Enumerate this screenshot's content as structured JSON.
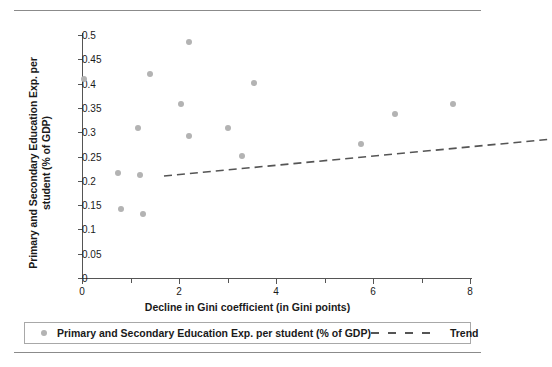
{
  "chart_data": {
    "type": "scatter",
    "title": "",
    "xlabel": "Decline in Gini coefficient (in Gini points)",
    "ylabel": "Primary and Secondary Education Exp. per student (% of GDP)",
    "xlim": [
      0,
      8
    ],
    "ylim": [
      0,
      0.5
    ],
    "grid": false,
    "legend_position": "bottom",
    "x_ticks": [
      0,
      2,
      4,
      6,
      8
    ],
    "x_tick_labels": [
      "0",
      "2",
      "4",
      "6",
      "8"
    ],
    "x_minor_ticks": [
      1,
      3,
      5,
      7
    ],
    "y_ticks": [
      0,
      0.05,
      0.1,
      0.15,
      0.2,
      0.25,
      0.3,
      0.35,
      0.4,
      0.45,
      0.5
    ],
    "y_tick_labels": [
      "0",
      "0.05",
      "0.1",
      "0.15",
      "0.2",
      "0.25",
      "0.3",
      "0.35",
      "0.4",
      "0.45",
      "0.5"
    ],
    "series": [
      {
        "name": "Primary and Secondary Education Exp. per student (% of GDP)",
        "marker": "circle",
        "color": "#b3b3b3",
        "points": [
          {
            "x": 0.05,
            "y": 0.41
          },
          {
            "x": 0.75,
            "y": 0.217
          },
          {
            "x": 0.8,
            "y": 0.143
          },
          {
            "x": 1.15,
            "y": 0.308
          },
          {
            "x": 1.2,
            "y": 0.211
          },
          {
            "x": 1.25,
            "y": 0.132
          },
          {
            "x": 1.4,
            "y": 0.42
          },
          {
            "x": 2.05,
            "y": 0.358
          },
          {
            "x": 2.2,
            "y": 0.485
          },
          {
            "x": 2.2,
            "y": 0.293
          },
          {
            "x": 3.0,
            "y": 0.308
          },
          {
            "x": 3.3,
            "y": 0.252
          },
          {
            "x": 3.55,
            "y": 0.401
          },
          {
            "x": 5.75,
            "y": 0.276
          },
          {
            "x": 6.45,
            "y": 0.337
          },
          {
            "x": 7.65,
            "y": 0.358
          }
        ]
      },
      {
        "name": "Trend",
        "marker": "dashed-line",
        "color": "#555555",
        "line": {
          "x0": 0.0,
          "y0": 0.282,
          "x1": 7.9,
          "y1": 0.357
        }
      }
    ]
  },
  "legend": {
    "scatter_label": "Primary and Secondary Education Exp. per student (% of GDP)",
    "trend_label": "Trend"
  }
}
